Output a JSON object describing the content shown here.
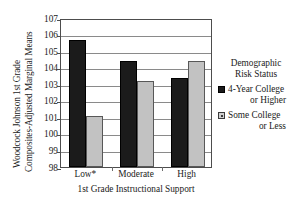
{
  "chart_data": {
    "type": "bar",
    "title": "",
    "subtitle": "",
    "ylabel_line1": "Woodcock Johnson 1st Grade",
    "ylabel_line2": "Composites-Adjusted Marginal Means",
    "xlabel": "1st Grade Instructional Support",
    "categories": [
      "Low*",
      "Moderate",
      "High"
    ],
    "series": [
      {
        "name": "4-Year College or Higher",
        "color": "#1b1b1b",
        "values": [
          105.7,
          104.4,
          103.4
        ]
      },
      {
        "name": "Some College or Less",
        "color": "#c2c2c2",
        "values": [
          101.1,
          103.2,
          104.4
        ]
      }
    ],
    "ylim": [
      98,
      107
    ],
    "yticks": [
      98,
      99,
      100,
      101,
      102,
      103,
      104,
      105,
      106,
      107
    ],
    "ytick_labels": [
      "98",
      "99",
      "100",
      "101",
      "102",
      "103",
      "104",
      "105",
      "106",
      "107"
    ],
    "grid": true,
    "grid_axis": "y",
    "legend_position": "right",
    "legend": {
      "title_line1": "Demographic",
      "title_line2": "Risk Status",
      "entries": [
        {
          "line1": "4-Year College",
          "line2": "or Higher",
          "swatch": "dark"
        },
        {
          "line1": "Some College",
          "line2": "or Less",
          "swatch": "light"
        }
      ]
    }
  }
}
